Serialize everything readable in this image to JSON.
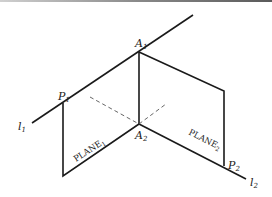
{
  "diagram": {
    "labels": {
      "A1": {
        "base": "A",
        "sub": "1"
      },
      "A2": {
        "base": "A",
        "sub": "2"
      },
      "P1": {
        "base": "P",
        "sub": "1"
      },
      "P2": {
        "base": "P",
        "sub": "2"
      },
      "l1": {
        "base": "l",
        "sub": "1"
      },
      "l2": {
        "base": "l",
        "sub": "2"
      },
      "plane1": {
        "base": "PLANE",
        "sub": "1"
      },
      "plane2": {
        "base": "PLANE",
        "sub": "2"
      }
    },
    "colors": {
      "stroke": "#1a1a1a",
      "dashed": "#555555",
      "background": "#ffffff"
    }
  }
}
